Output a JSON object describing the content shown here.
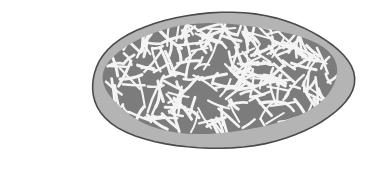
{
  "illustration": {
    "subject": "pizza-with-shredded-cheese",
    "colors": {
      "background": "#ffffff",
      "crust_fill": "#b4b4b4",
      "crust_outline": "#4a4a4a",
      "sauce_fill": "#7c7c7c",
      "cheese": "#f4f4f4"
    },
    "crust": {
      "cx": 221,
      "cy": 81,
      "rx": 131,
      "ry": 68
    },
    "sauce": {
      "cx": 219,
      "cy": 78,
      "rx": 117,
      "ry": 55
    },
    "cheese": {
      "count": 230,
      "seed": 7,
      "min_len": 10,
      "max_len": 30,
      "stroke_width": 2.6
    }
  }
}
